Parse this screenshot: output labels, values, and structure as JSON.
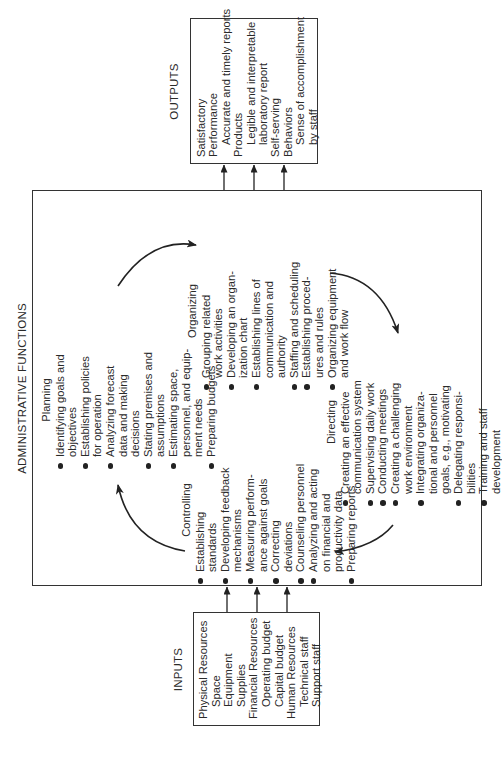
{
  "diagram": {
    "title": "ADMINISTRATIVE FUNCTIONS",
    "orientation": "rotated 90 degrees counter-clockwise",
    "inputs": {
      "label": "INPUTS",
      "groups": [
        {
          "header": "Physical Resources",
          "items": [
            "Space",
            "Equipment",
            "Supplies"
          ]
        },
        {
          "header": "Financial Resources",
          "items": [
            "Operating budget",
            "Capital budget"
          ]
        },
        {
          "header": "Human Resources",
          "items": [
            "Technical staff",
            "Support staff"
          ]
        }
      ]
    },
    "outputs": {
      "label": "OUTPUTS",
      "groups": [
        {
          "header": "Satisfactory",
          "items": []
        },
        {
          "header": "Performance",
          "items": [
            "Accurate and timely reports"
          ]
        },
        {
          "header": "Products",
          "items": [
            "Legible and interpretable\nlaboratory report"
          ]
        },
        {
          "header": "Self-serving",
          "items": []
        },
        {
          "header": "Behaviors",
          "items": [
            "Sense of accomplishment\nby staff"
          ]
        }
      ]
    },
    "functions": {
      "planning": {
        "title": "Planning",
        "items": [
          "Identifying goals and\nobjectives",
          "Establishing policies\nfor operation",
          "Analyzing forecast\ndata and making\ndecisions",
          "Stating premises and\nassumptions",
          "Estimating space,\npersonnel, and equip-\nment needs",
          "Preparing budgets"
        ]
      },
      "organizing": {
        "title": "Organizing",
        "items": [
          "Grouping related\nwork activities",
          "Developing an organ-\nization chart",
          "Establishing lines of\ncommunication and\nauthority",
          "Staffing and scheduling",
          "Establishing proced-\nures and rules",
          "Organizing equipment\nand work flow"
        ]
      },
      "directing": {
        "title": "Directing",
        "items": [
          "Creating an effective\ncommunication system",
          "Supervising daily work",
          "Conducting meetings",
          "Creating a challenging\nwork environment",
          "Integrating organiza-\ntional and personnel\ngoals, e.g., motivating",
          "Delegating responsi-\nbilities",
          "Training and staff\ndevelopment"
        ]
      },
      "controlling": {
        "title": "Controlling",
        "items": [
          "Establishing\nstandards",
          "Developing feedback\nmechanisms",
          "Measuring perform-\nance against goals",
          "Correcting\ndeviations",
          "Counseling personnel",
          "Analyzing and acting\non financial and\nproductivity data",
          "Preparing reports"
        ]
      }
    },
    "cycle_order": [
      "Planning",
      "Organizing",
      "Directing",
      "Controlling"
    ],
    "colors": {
      "line": "#333333",
      "text": "#2a2a2a",
      "background": "#ffffff"
    }
  }
}
